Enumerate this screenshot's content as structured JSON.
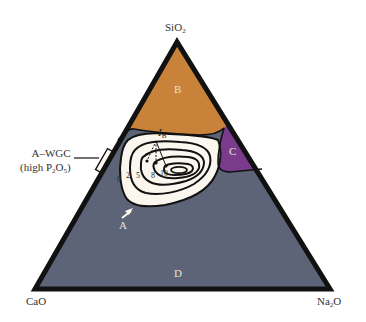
{
  "diagram": {
    "type": "ternary phase diagram",
    "vertices": {
      "top": {
        "label": "SiO",
        "sub": "2"
      },
      "bottom_left": {
        "label": "CaO",
        "sub": ""
      },
      "bottom_right": {
        "label": "Na",
        "sub": "2",
        "suffix": "O"
      }
    },
    "regions": {
      "B": {
        "label": "B",
        "color": "#c8823a"
      },
      "C": {
        "label": "C",
        "color": "#7b3b8d"
      },
      "D": {
        "label": "D",
        "color": "#5d6478"
      },
      "A": {
        "label": "A",
        "color": "#fbf7ee"
      }
    },
    "annotation": {
      "line1": "A–WGC",
      "line2_prefix": "(high P",
      "line2_sub1": "2",
      "line2_mid": "O",
      "line2_sub2": "5",
      "line2_suffix": ")"
    },
    "boundary_label": {
      "main": "I",
      "sub": "B"
    },
    "contour_labels": [
      "0",
      "2",
      "5",
      "8",
      "10"
    ],
    "colors": {
      "outline": "#111111",
      "background": "#ffffff"
    }
  }
}
